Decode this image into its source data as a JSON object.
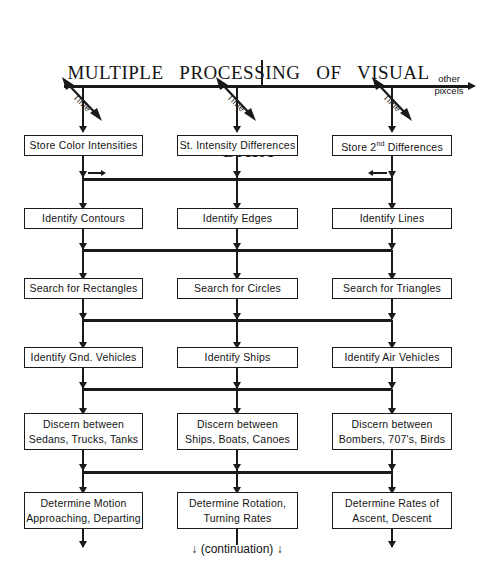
{
  "title": {
    "line1": "MULTIPLE   PROCESSING   OF   VISUAL",
    "line2": "DATA"
  },
  "axis": {
    "other_label": "other",
    "pixcels_label": "pixcels",
    "time_label_1": "Time",
    "time_label_2": "Time",
    "time_label_3": "Time"
  },
  "columns": [
    {
      "name": "color-intensities",
      "stages": [
        {
          "line1": "Store Color Intensities",
          "line2": ""
        },
        {
          "line1": "Identify Contours",
          "line2": ""
        },
        {
          "line1": "Search for Rectangles",
          "line2": ""
        },
        {
          "line1": "Identify Gnd. Vehicles",
          "line2": ""
        },
        {
          "line1": "Discern  between",
          "line2": "Sedans, Trucks, Tanks"
        },
        {
          "line1": "Determine  Motion",
          "line2": "Approaching, Departing"
        }
      ]
    },
    {
      "name": "intensity-differences",
      "stages": [
        {
          "line1": "St. Intensity Differences",
          "line2": ""
        },
        {
          "line1": "Identify Edges",
          "line2": ""
        },
        {
          "line1": "Search for Circles",
          "line2": ""
        },
        {
          "line1": "Identify Ships",
          "line2": ""
        },
        {
          "line1": "Discern  between",
          "line2": "Ships, Boats, Canoes"
        },
        {
          "line1": "Determine  Rotation,",
          "line2": "Turning Rates"
        }
      ]
    },
    {
      "name": "second-differences",
      "stages": [
        {
          "line1": "Store 2nd Differences",
          "line2": "",
          "sup_base": "Store 2",
          "sup": "nd",
          "sup_tail": " Differences"
        },
        {
          "line1": "Identify Lines",
          "line2": ""
        },
        {
          "line1": "Search for Triangles",
          "line2": ""
        },
        {
          "line1": "Identify Air Vehicles",
          "line2": ""
        },
        {
          "line1": "Discern  between",
          "line2": "Bombers, 707's, Birds"
        },
        {
          "line1": "Determine  Rates of",
          "line2": "Ascent, Descent"
        }
      ]
    }
  ],
  "footer": {
    "continuation": "↓ (continuation) ↓"
  },
  "colors": {
    "ink": "#1a1a1a",
    "background": "#ffffff"
  }
}
